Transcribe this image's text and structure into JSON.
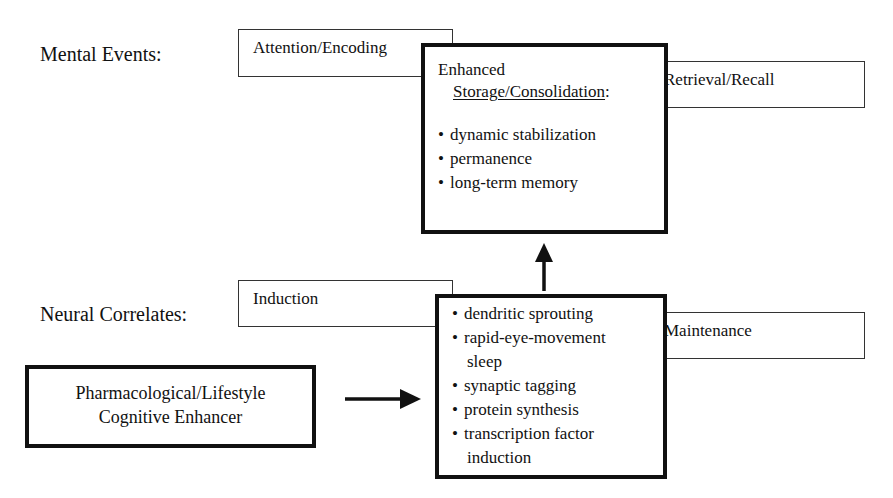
{
  "rows": {
    "mental": {
      "label": "Mental Events:"
    },
    "neural": {
      "label": "Neural Correlates:"
    }
  },
  "mental_events": {
    "attention": {
      "label": "Attention/Encoding"
    },
    "storage": {
      "title_line1": "Enhanced",
      "title_line2": "Storage/Consolidation",
      "title_colon": ":",
      "items": [
        "dynamic stabilization",
        "permanence",
        "long-term memory"
      ]
    },
    "retrieval": {
      "label": "Retrieval/Recall"
    }
  },
  "neural_correlates": {
    "induction": {
      "label": "Induction"
    },
    "mechanisms": {
      "items": [
        "dendritic sprouting",
        "rapid-eye-movement\nsleep",
        "synaptic tagging",
        "protein synthesis",
        "transcription factor\ninduction"
      ],
      "items_display": [
        {
          "line1": "dendritic sprouting",
          "line2": ""
        },
        {
          "line1": "rapid-eye-movement",
          "line2": "sleep"
        },
        {
          "line1": "synaptic tagging",
          "line2": ""
        },
        {
          "line1": "protein synthesis",
          "line2": ""
        },
        {
          "line1": "transcription factor",
          "line2": "induction"
        }
      ]
    },
    "maintenance": {
      "label": "Maintenance"
    }
  },
  "enhancer": {
    "line1": "Pharmacological/Lifestyle",
    "line2": "Cognitive Enhancer"
  },
  "arrows": [
    {
      "from": "enhancer",
      "to": "neural-mechanisms",
      "direction": "right"
    },
    {
      "from": "neural-mechanisms",
      "to": "storage-consolidation",
      "direction": "up"
    }
  ]
}
